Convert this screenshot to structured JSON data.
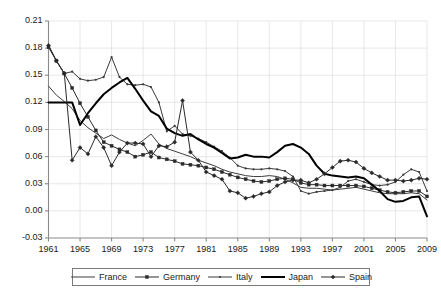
{
  "chart_data": {
    "type": "line",
    "title": "",
    "xlabel": "",
    "ylabel": "",
    "xlim": [
      1961,
      2009
    ],
    "ylim": [
      -0.03,
      0.21
    ],
    "ytick_values": [
      -0.03,
      0.0,
      0.03,
      0.06,
      0.09,
      0.12,
      0.15,
      0.18,
      0.21
    ],
    "ytick_labels": [
      "-0.03",
      "0.00",
      "0.03",
      "0.06",
      "0.09",
      "0.12",
      "0.15",
      "0.18",
      "0.21"
    ],
    "xtick_values": [
      1961,
      1965,
      1969,
      1973,
      1977,
      1981,
      1985,
      1989,
      1993,
      1997,
      2001,
      2005,
      2009
    ],
    "xtick_labels": [
      "1961",
      "1965",
      "1969",
      "1973",
      "1977",
      "1981",
      "1985",
      "1989",
      "1993",
      "1997",
      "2001",
      "2005",
      "2009"
    ],
    "grid": true,
    "legend_position": "bottom",
    "x": [
      1961,
      1962,
      1963,
      1964,
      1965,
      1966,
      1967,
      1968,
      1969,
      1970,
      1971,
      1972,
      1973,
      1974,
      1975,
      1976,
      1977,
      1978,
      1979,
      1980,
      1981,
      1982,
      1983,
      1984,
      1985,
      1986,
      1987,
      1988,
      1989,
      1990,
      1991,
      1992,
      1993,
      1994,
      1995,
      1996,
      1997,
      1998,
      1999,
      2000,
      2001,
      2002,
      2003,
      2004,
      2005,
      2006,
      2007,
      2008,
      2009
    ],
    "series": [
      {
        "name": "France",
        "color": "#3c3c3c",
        "line_width": 1,
        "marker": "none",
        "values": [
          0.138,
          0.128,
          0.121,
          0.113,
          0.1,
          0.092,
          0.086,
          0.08,
          0.084,
          0.079,
          0.075,
          0.072,
          0.078,
          0.085,
          0.074,
          0.069,
          0.066,
          0.063,
          0.06,
          0.056,
          0.053,
          0.05,
          0.046,
          0.043,
          0.041,
          0.039,
          0.038,
          0.038,
          0.039,
          0.038,
          0.035,
          0.031,
          0.026,
          0.025,
          0.025,
          0.024,
          0.023,
          0.024,
          0.025,
          0.026,
          0.024,
          0.022,
          0.02,
          0.019,
          0.019,
          0.019,
          0.02,
          0.019,
          0.012
        ]
      },
      {
        "name": "Germany",
        "color": "#2a2a2a",
        "line_width": 1,
        "marker": "square",
        "values": [
          0.181,
          0.166,
          0.152,
          0.136,
          0.119,
          0.104,
          0.089,
          0.076,
          0.072,
          0.068,
          0.065,
          0.06,
          0.062,
          0.065,
          0.059,
          0.057,
          0.055,
          0.052,
          0.051,
          0.05,
          0.048,
          0.046,
          0.043,
          0.04,
          0.037,
          0.035,
          0.033,
          0.032,
          0.033,
          0.035,
          0.036,
          0.035,
          0.031,
          0.029,
          0.029,
          0.028,
          0.028,
          0.028,
          0.028,
          0.028,
          0.027,
          0.025,
          0.023,
          0.021,
          0.02,
          0.021,
          0.022,
          0.022,
          0.016
        ]
      },
      {
        "name": "Italy",
        "color": "#3a3a3a",
        "line_width": 1,
        "marker": "dot",
        "values": [
          0.183,
          0.166,
          0.152,
          0.154,
          0.146,
          0.144,
          0.145,
          0.148,
          0.17,
          0.148,
          0.14,
          0.139,
          0.14,
          0.137,
          0.12,
          0.088,
          0.094,
          0.085,
          0.083,
          0.08,
          0.076,
          0.071,
          0.066,
          0.059,
          0.05,
          0.047,
          0.046,
          0.046,
          0.047,
          0.046,
          0.044,
          0.038,
          0.022,
          0.019,
          0.021,
          0.022,
          0.023,
          0.026,
          0.033,
          0.035,
          0.032,
          0.029,
          0.028,
          0.029,
          0.032,
          0.04,
          0.046,
          0.043,
          0.022
        ]
      },
      {
        "name": "Japan",
        "color": "#000000",
        "line_width": 2,
        "marker": "none",
        "values": [
          0.12,
          0.12,
          0.12,
          0.12,
          0.095,
          0.108,
          0.119,
          0.129,
          0.136,
          0.142,
          0.147,
          0.135,
          0.122,
          0.11,
          0.105,
          0.091,
          0.086,
          0.083,
          0.085,
          0.079,
          0.074,
          0.07,
          0.064,
          0.058,
          0.059,
          0.062,
          0.06,
          0.06,
          0.059,
          0.065,
          0.072,
          0.074,
          0.07,
          0.063,
          0.05,
          0.041,
          0.039,
          0.038,
          0.037,
          0.038,
          0.036,
          0.029,
          0.022,
          0.013,
          0.01,
          0.011,
          0.015,
          0.016,
          -0.006
        ]
      },
      {
        "name": "Spain",
        "color": "#2a2a2a",
        "line_width": 1,
        "marker": "diamond",
        "values": [
          0.183,
          0.166,
          0.152,
          0.056,
          0.07,
          0.063,
          0.082,
          0.07,
          0.05,
          0.065,
          0.075,
          0.075,
          0.074,
          0.06,
          0.072,
          0.071,
          0.076,
          0.122,
          0.065,
          0.056,
          0.043,
          0.039,
          0.035,
          0.022,
          0.02,
          0.014,
          0.016,
          0.019,
          0.021,
          0.028,
          0.032,
          0.034,
          0.034,
          0.031,
          0.035,
          0.041,
          0.048,
          0.055,
          0.056,
          0.054,
          0.047,
          0.042,
          0.038,
          0.034,
          0.034,
          0.033,
          0.034,
          0.036,
          0.035
        ]
      }
    ]
  },
  "legend": {
    "entries": [
      {
        "label": "France",
        "marker": "none"
      },
      {
        "label": "Germany",
        "marker": "square"
      },
      {
        "label": "Italy",
        "marker": "dot"
      },
      {
        "label": "Japan",
        "marker": "none"
      },
      {
        "label": "Spain",
        "marker": "diamond"
      }
    ]
  },
  "axis_colors": {
    "axis_line": "#8a8a8a",
    "grid_line": "#d8d8d8",
    "tick_text": "#1a1a1a"
  }
}
